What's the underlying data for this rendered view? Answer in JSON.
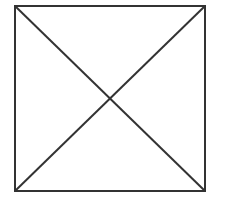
{
  "diagram": {
    "type": "square-with-diagonals",
    "stroke_color": "#333333",
    "background": "#ffffff",
    "stroke_width": 2,
    "square": {
      "x": 15,
      "y": 6,
      "width": 190,
      "height": 185
    },
    "diagonals": [
      {
        "x1": 15,
        "y1": 6,
        "x2": 205,
        "y2": 191
      },
      {
        "x1": 205,
        "y1": 6,
        "x2": 15,
        "y2": 191
      }
    ]
  }
}
